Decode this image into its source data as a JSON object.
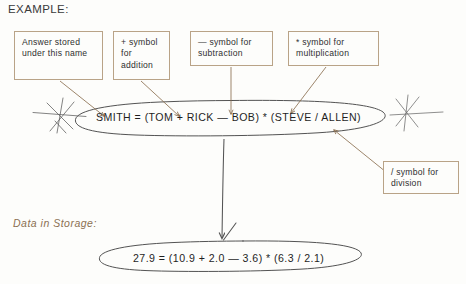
{
  "page": {
    "title": "EXAMPLE:",
    "storage_label": "Data in Storage:",
    "background_color": "#fdfdfb",
    "box_border_color": "#b9a387",
    "annotation_color": "#8b7052",
    "ink_color": "#4a4a4a",
    "text_color": "#2f2f2f"
  },
  "callouts": [
    {
      "id": "answer-name",
      "text": "Answer stored under this name"
    },
    {
      "id": "plus-symbol",
      "text": "+ symbol for addition"
    },
    {
      "id": "minus-symbol",
      "text": "— symbol for subtraction"
    },
    {
      "id": "star-symbol",
      "text": "* symbol for multiplication"
    },
    {
      "id": "slash-symbol",
      "text": "/ symbol for division"
    }
  ],
  "equations": {
    "symbolic": "SMITH = (TOM + RICK — BOB) * (STEVE / ALLEN)",
    "numeric": "27.9 = (10.9 + 2.0 — 3.6) * (6.3 / 2.1)"
  }
}
